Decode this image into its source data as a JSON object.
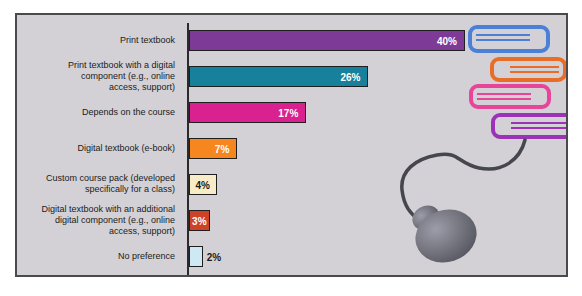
{
  "chart_data": {
    "type": "bar",
    "orientation": "horizontal",
    "title": "",
    "xlabel": "",
    "ylabel": "",
    "xlim": [
      0,
      42
    ],
    "grid": false,
    "legend": false,
    "categories": [
      "Print textbook",
      "Print textbook with a digital component (e.g., online access, support)",
      "Depends on the course",
      "Digital textbook (e-book)",
      "Custom course pack (developed specifically for a class)",
      "Digital textbook with an additional digital component (e.g., online access, support)",
      "No preference"
    ],
    "values": [
      40,
      26,
      17,
      7,
      4,
      3,
      2
    ],
    "bars": [
      {
        "label": "Print textbook",
        "value": 40,
        "display": "40%",
        "color": "#7e3a97",
        "text_color": "#ffffff",
        "text_position": "inside-right"
      },
      {
        "label": "Print textbook with a digital\ncomponent (e.g., online\naccess, support)",
        "value": 26,
        "display": "26%",
        "color": "#17809b",
        "text_color": "#ffffff",
        "text_position": "inside-right"
      },
      {
        "label": "Depends on the course",
        "value": 17,
        "display": "17%",
        "color": "#da2190",
        "text_color": "#ffffff",
        "text_position": "inside-right"
      },
      {
        "label": "Digital textbook (e-book)",
        "value": 7,
        "display": "7%",
        "color": "#f6871f",
        "text_color": "#ffffff",
        "text_position": "inside-right"
      },
      {
        "label": "Custom course pack (developed\nspecifically for a class)",
        "value": 4,
        "display": "4%",
        "color": "#f8ecc8",
        "text_color": "#1b1b1b",
        "text_position": "center"
      },
      {
        "label": "Digital textbook with an additional\ndigital component (e.g., online\naccess, support)",
        "value": 3,
        "display": "3%",
        "color": "#ce4327",
        "text_color": "#ffffff",
        "text_position": "center"
      },
      {
        "label": "No preference",
        "value": 2,
        "display": "2%",
        "color": "#cfe9f4",
        "text_color": "#1b1b1b",
        "text_position": "outside"
      }
    ]
  },
  "panel": {
    "bg": "#d3d1d5",
    "border": "#4a4a4c",
    "axis_color": "#2b2b2b",
    "text_color": "#1b1b1b"
  },
  "illustration": {
    "books": [
      {
        "name": "blue-book",
        "color": "#4a80d8"
      },
      {
        "name": "orange-book",
        "color": "#ea6d27"
      },
      {
        "name": "pink-book",
        "color": "#e7449a"
      },
      {
        "name": "purple-book",
        "color": "#9c32b7"
      }
    ],
    "mouse": {
      "cable_color": "#46464e",
      "body_color": "#55555f",
      "highlight_color": "#9d9da9"
    }
  }
}
